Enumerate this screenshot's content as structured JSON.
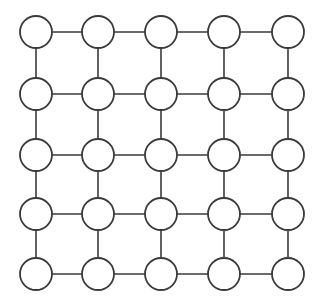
{
  "diagram": {
    "type": "grid-graph",
    "rows": 5,
    "cols": 5,
    "node_radius": 16,
    "col_x": [
      36,
      98,
      161,
      224,
      288
    ],
    "row_y": [
      32,
      94,
      155,
      214,
      274
    ],
    "colors": {
      "stroke": "#3a3a3a",
      "node_fill": "#ffffff",
      "background": "#ffffff"
    },
    "edges": "4-neighbor lattice (horizontal and vertical connections between adjacent nodes)"
  }
}
